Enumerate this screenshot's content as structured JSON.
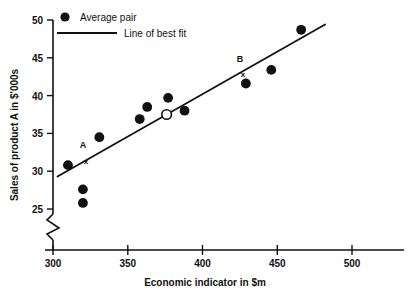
{
  "chart_data": {
    "type": "scatter",
    "title": "",
    "xlabel": "Economic indicator in $m",
    "ylabel": "Sales of product A in $'000s",
    "xlim": [
      300,
      520
    ],
    "ylim": [
      24,
      50
    ],
    "xticks": [
      300,
      350,
      400,
      450,
      500
    ],
    "yticks": [
      25,
      30,
      35,
      40,
      45,
      50
    ],
    "grid": false,
    "y_axis_break": true,
    "legend_position": "top-left",
    "legend": [
      {
        "key": "average-pair",
        "label": "Average pair",
        "marker": "filled-circle"
      },
      {
        "key": "line-of-best-fit",
        "label": "Line of best fit",
        "marker": "line"
      }
    ],
    "series": [
      {
        "name": "Average pair",
        "marker": "filled-circle",
        "points": [
          {
            "x": 310,
            "y": 30.8
          },
          {
            "x": 320,
            "y": 27.6
          },
          {
            "x": 320,
            "y": 25.8
          },
          {
            "x": 331,
            "y": 34.5
          },
          {
            "x": 358,
            "y": 36.9
          },
          {
            "x": 363,
            "y": 38.5
          },
          {
            "x": 377,
            "y": 39.7
          },
          {
            "x": 388,
            "y": 38.0
          },
          {
            "x": 429,
            "y": 41.6
          },
          {
            "x": 446,
            "y": 43.4
          },
          {
            "x": 466,
            "y": 48.7
          }
        ]
      },
      {
        "name": "Mean point",
        "marker": "open-circle",
        "points": [
          {
            "x": 376,
            "y": 37.5
          }
        ]
      }
    ],
    "line_of_best_fit": {
      "x_start": 303,
      "y_start": 29.3,
      "x_end": 482,
      "y_end": 49.4
    },
    "annotations": [
      {
        "id": "A",
        "label": "A",
        "marker": "x",
        "x": 322,
        "y": 31.3,
        "label_x": 320,
        "label_y": 33.4
      },
      {
        "id": "B",
        "label": "B",
        "marker": "x",
        "x": 427,
        "y": 42.8,
        "label_x": 425,
        "label_y": 44.9
      }
    ]
  },
  "axis": {
    "y_title": "Sales of product A in $'000s",
    "x_title": "Economic indicator in $m",
    "x_tick_labels": [
      "300",
      "350",
      "400",
      "450",
      "500"
    ],
    "y_tick_labels": [
      "25",
      "30",
      "35",
      "40",
      "45",
      "50"
    ]
  },
  "legend": {
    "average_pair": "Average pair",
    "line_of_best_fit": "Line of best fit"
  },
  "labels": {
    "point_a": "A",
    "point_b": "B",
    "x_marker": "x"
  },
  "colors": {
    "ink": "#111111",
    "background": "#ffffff"
  }
}
